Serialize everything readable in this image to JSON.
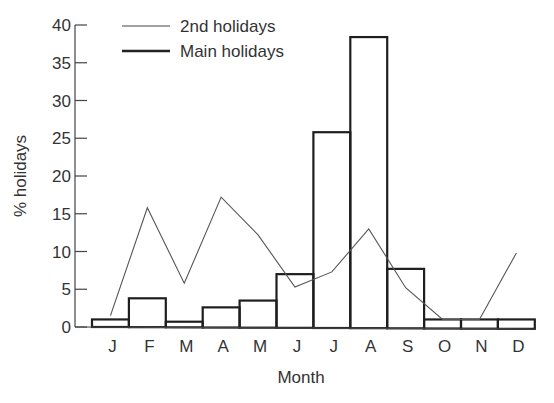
{
  "chart_data": {
    "type": "bar+line",
    "title": "",
    "xlabel": "Month",
    "ylabel": "% holidays",
    "ylim": [
      0,
      40
    ],
    "yticks": [
      0,
      5,
      10,
      15,
      20,
      25,
      30,
      35,
      40
    ],
    "categories": [
      "J",
      "F",
      "M",
      "A",
      "M",
      "J",
      "J",
      "A",
      "S",
      "O",
      "N",
      "D"
    ],
    "series": [
      {
        "name": "Main holidays",
        "kind": "bar",
        "values": [
          1.0,
          3.8,
          0.7,
          2.6,
          3.5,
          7.0,
          25.8,
          38.4,
          7.7,
          1.0,
          1.0,
          1.0
        ]
      },
      {
        "name": "2nd holidays",
        "kind": "line",
        "values": [
          1.5,
          15.8,
          5.8,
          17.2,
          12.2,
          5.3,
          7.3,
          13.0,
          5.2,
          1.0,
          1.0,
          9.8
        ]
      }
    ],
    "legend": {
      "position": "top-left-inside",
      "entries": [
        "2nd holidays",
        "Main holidays"
      ]
    },
    "grid": false
  },
  "legend": {
    "line_label": "2nd holidays",
    "bar_label": "Main holidays"
  },
  "axes": {
    "x_title": "Month",
    "y_title": "% holidays"
  }
}
